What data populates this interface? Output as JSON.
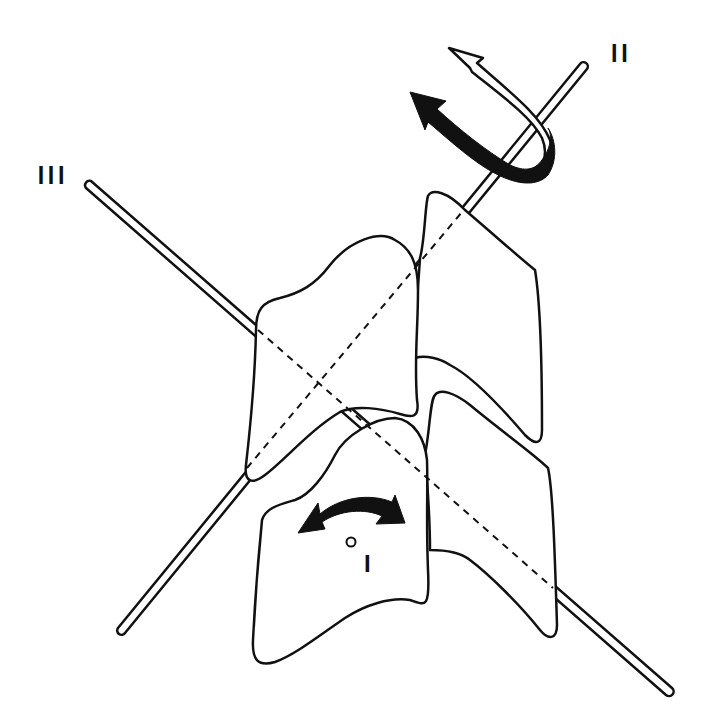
{
  "diagram": {
    "axes": [
      {
        "id": "axis-I",
        "label": "I",
        "description": "axial rotation axis (perpendicular, marked by circle)"
      },
      {
        "id": "axis-II",
        "label": "II",
        "description": "diagonal axis running lower-left to upper-right"
      },
      {
        "id": "axis-III",
        "label": "III",
        "description": "diagonal axis running upper-left to lower-right"
      }
    ],
    "labels": {
      "axis_i": "I",
      "axis_ii": "II",
      "axis_iii": "III"
    },
    "colors": {
      "ink": "#111111",
      "background": "#ffffff"
    },
    "arrows": [
      {
        "id": "rotation-arrow-ii-solid",
        "axis": "II",
        "style": "solid black curved arrow"
      },
      {
        "id": "rotation-arrow-ii-hollow",
        "axis": "II",
        "style": "hollow curved arrow"
      },
      {
        "id": "rotation-arrow-i",
        "axis": "I",
        "style": "double-headed curved black arrow"
      }
    ]
  }
}
